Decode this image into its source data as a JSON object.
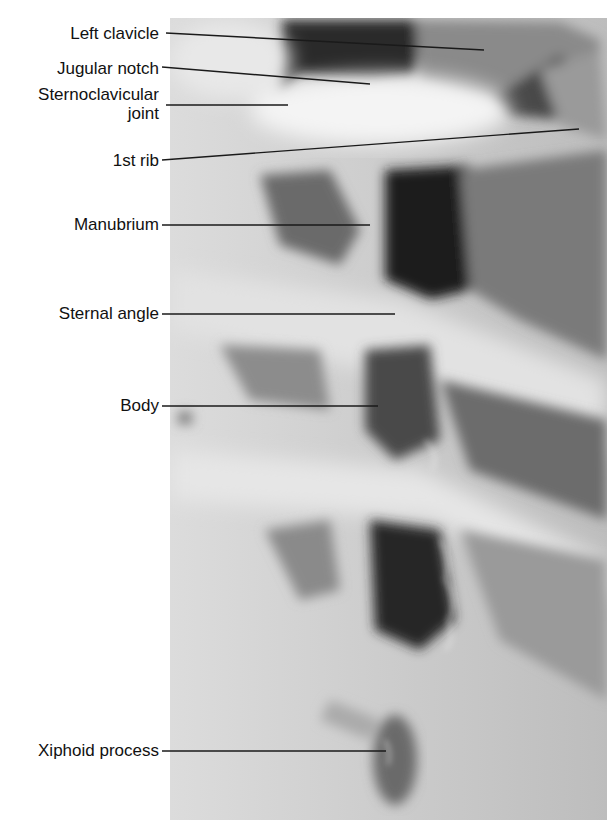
{
  "figure": {
    "labels": [
      {
        "text": "Left clavicle",
        "line": [
          166,
          33,
          484,
          50
        ]
      },
      {
        "text": "Jugular notch",
        "line": [
          162,
          67,
          370,
          84
        ]
      },
      {
        "text": "Sternoclavicular",
        "text2": "joint",
        "line": [
          166,
          105,
          288,
          105
        ]
      },
      {
        "text": "1st rib",
        "line": [
          162,
          160,
          579,
          129
        ]
      },
      {
        "text": "Manubrium",
        "line": [
          162,
          225,
          370,
          225
        ]
      },
      {
        "text": "Sternal angle",
        "line": [
          162,
          314,
          395,
          314
        ]
      },
      {
        "text": "Body",
        "line": [
          162,
          406,
          378,
          406
        ]
      },
      {
        "text": "Xiphoid process",
        "line": [
          162,
          751,
          386,
          751
        ]
      }
    ]
  }
}
